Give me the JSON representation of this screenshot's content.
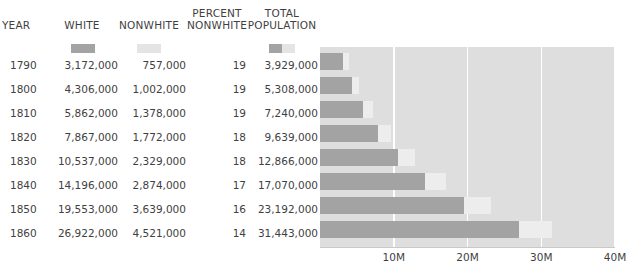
{
  "table": {
    "headers": [
      {
        "key": "year",
        "line1": "YEAR",
        "line2": ""
      },
      {
        "key": "white",
        "line1": "WHITE",
        "line2": ""
      },
      {
        "key": "nonwhite",
        "line1": "NONWHITE",
        "line2": ""
      },
      {
        "key": "pct_nonwhite",
        "line1": "PERCENT",
        "line2": "NONWHITE"
      },
      {
        "key": "total",
        "line1": "TOTAL",
        "line2": "POPULATION"
      }
    ],
    "rows": [
      {
        "year": "1790",
        "white": "3,172,000",
        "nonwhite": "757,000",
        "pct_nonwhite": "19",
        "total": "3,929,000"
      },
      {
        "year": "1800",
        "white": "4,306,000",
        "nonwhite": "1,002,000",
        "pct_nonwhite": "19",
        "total": "5,308,000"
      },
      {
        "year": "1810",
        "white": "5,862,000",
        "nonwhite": "1,378,000",
        "pct_nonwhite": "19",
        "total": "7,240,000"
      },
      {
        "year": "1820",
        "white": "7,867,000",
        "nonwhite": "1,772,000",
        "pct_nonwhite": "18",
        "total": "9,639,000"
      },
      {
        "year": "1830",
        "white": "10,537,000",
        "nonwhite": "2,329,000",
        "pct_nonwhite": "18",
        "total": "12,866,000"
      },
      {
        "year": "1840",
        "white": "14,196,000",
        "nonwhite": "2,874,000",
        "pct_nonwhite": "17",
        "total": "17,070,000"
      },
      {
        "year": "1850",
        "white": "19,553,000",
        "nonwhite": "3,639,000",
        "pct_nonwhite": "16",
        "total": "23,192,000"
      },
      {
        "year": "1860",
        "white": "26,922,000",
        "nonwhite": "4,521,000",
        "pct_nonwhite": "14",
        "total": "31,443,000"
      }
    ]
  },
  "legend": {
    "white_color": "#a3a3a3",
    "nonwhite_color": "#e4e4e4",
    "white_label": "WHITE",
    "nonwhite_label": "NONWHITE",
    "total_label": "TOTAL POPULATION"
  },
  "chart_data": {
    "type": "bar",
    "orientation": "horizontal",
    "stacked": true,
    "title": "",
    "xlabel": "",
    "ylabel": "YEAR",
    "categories": [
      "1790",
      "1800",
      "1810",
      "1820",
      "1830",
      "1840",
      "1850",
      "1860"
    ],
    "series": [
      {
        "name": "WHITE",
        "color": "#a3a3a3",
        "values": [
          3172000,
          4306000,
          5862000,
          7867000,
          10537000,
          14196000,
          19553000,
          26922000
        ]
      },
      {
        "name": "NONWHITE",
        "color": "#ededed",
        "values": [
          757000,
          1002000,
          1378000,
          1772000,
          2329000,
          2874000,
          3639000,
          4521000
        ]
      }
    ],
    "totals": [
      3929000,
      5308000,
      7240000,
      9639000,
      12866000,
      17070000,
      23192000,
      31443000
    ],
    "percent_nonwhite": [
      19,
      19,
      19,
      18,
      18,
      17,
      16,
      14
    ],
    "xlim": [
      0,
      40000000
    ],
    "xticks": [
      10000000,
      20000000,
      30000000,
      40000000
    ],
    "xtick_labels": [
      "10M",
      "20M",
      "30M",
      "40M"
    ],
    "grid": true,
    "grid_color": "#ffffff",
    "plot_background": "#dedede",
    "legend_position": "top-left-table-header"
  }
}
